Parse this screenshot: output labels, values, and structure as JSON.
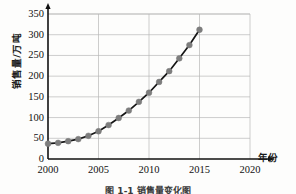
{
  "chart_data": {
    "type": "line",
    "title": "",
    "xlabel": "年份",
    "ylabel": "销售量/万吨",
    "xlim": [
      2000,
      2020
    ],
    "ylim": [
      0,
      350
    ],
    "grid": true,
    "legend": false,
    "marker": "circle",
    "marker_color": "#7d7d7d",
    "line_color": "#151515",
    "x": [
      2000,
      2001,
      2002,
      2003,
      2004,
      2005,
      2006,
      2007,
      2008,
      2009,
      2010,
      2011,
      2012,
      2013,
      2014,
      2015
    ],
    "values": [
      37,
      39,
      43,
      48,
      56,
      67,
      82,
      99,
      117,
      138,
      160,
      186,
      212,
      243,
      275,
      312
    ],
    "xticks": [
      "2000",
      "2005",
      "2010",
      "2015",
      "2020"
    ],
    "xtick_values": [
      2000,
      2005,
      2010,
      2015,
      2020
    ],
    "yticks": [
      "0",
      "50",
      "100",
      "150",
      "200",
      "250",
      "300",
      "350"
    ],
    "ytick_values": [
      0,
      50,
      100,
      150,
      200,
      250,
      300,
      350
    ]
  },
  "figure": {
    "caption": "图 1-1  销售量变化图"
  },
  "colors": {
    "axis": "#111111",
    "grid": "#b8b8b8",
    "line": "#151515",
    "marker": "#7d7d7d",
    "background": "#fdfdfc"
  }
}
